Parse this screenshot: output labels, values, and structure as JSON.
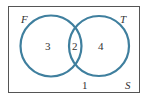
{
  "diagram": {
    "type": "venn",
    "universe": {
      "label": "S",
      "outside_count": "1"
    },
    "sets": [
      {
        "label": "F",
        "only_count": "3"
      },
      {
        "label": "T",
        "only_count": "4"
      }
    ],
    "intersection_count": "2",
    "colors": {
      "circle_stroke": "#3f7f9e",
      "border": "#555555",
      "text": "#333333",
      "background": "#ffffff"
    }
  }
}
